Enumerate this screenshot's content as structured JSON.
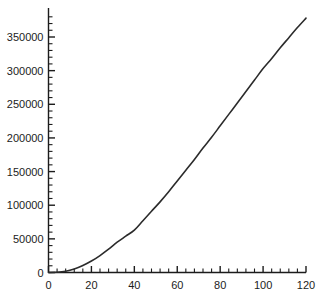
{
  "chart_data": {
    "type": "line",
    "title": "",
    "subtitle": "",
    "xlabel": "",
    "ylabel": "",
    "xlim": [
      0,
      120
    ],
    "ylim": [
      0,
      385000
    ],
    "grid": false,
    "legend": null,
    "annotations": [],
    "axis_color": "#1c1c1c",
    "line_color": "#2b2b2b",
    "background_color": "#ffffff",
    "xticks": [
      0,
      20,
      40,
      60,
      80,
      100,
      120
    ],
    "xtick_labels": [
      "0",
      "20",
      "40",
      "60",
      "80",
      "100",
      "120"
    ],
    "x_minor_tick_step": 4,
    "yticks": [
      0,
      50000,
      100000,
      150000,
      200000,
      250000,
      300000,
      350000
    ],
    "ytick_labels": [
      "0",
      "50000",
      "100000",
      "150000",
      "200000",
      "250000",
      "300000",
      "350000"
    ],
    "y_minor_tick_step": 10000,
    "series": [
      {
        "name": "curve",
        "x": [
          0,
          4,
          8,
          12,
          16,
          20,
          24,
          28,
          32,
          36,
          40,
          44,
          48,
          52,
          56,
          60,
          64,
          68,
          72,
          76,
          80,
          84,
          88,
          92,
          96,
          100,
          104,
          108,
          112,
          116,
          120
        ],
        "values": [
          0,
          300,
          1800,
          5200,
          10400,
          17000,
          25200,
          34600,
          45000,
          54000,
          63000,
          77000,
          91000,
          105000,
          120000,
          136000,
          152000,
          168000,
          185000,
          201000,
          218000,
          235000,
          252000,
          269000,
          286000,
          303000,
          318000,
          334000,
          349000,
          364000,
          378000
        ]
      }
    ]
  }
}
